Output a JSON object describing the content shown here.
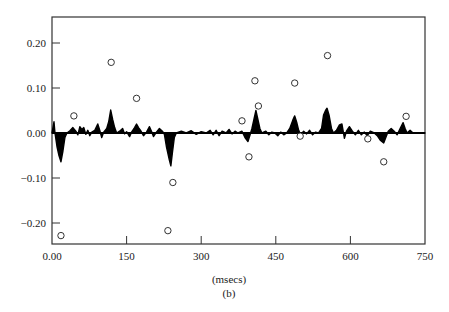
{
  "chart_data": {
    "type": "line",
    "title": "",
    "subtitle": "(b)",
    "xlabel": "(msecs)",
    "ylabel": "",
    "xlim": [
      0,
      750
    ],
    "ylim": [
      -0.25,
      0.26
    ],
    "grid": false,
    "legend": null,
    "x_ticks": [
      0,
      150,
      300,
      450,
      600,
      750
    ],
    "x_tick_labels": [
      "0.00",
      "150",
      "300",
      "450",
      "600",
      "750"
    ],
    "y_ticks": [
      0.2,
      0.1,
      0.0,
      -0.1,
      -0.2
    ],
    "y_tick_labels": [
      "0.20",
      "0.10",
      "0.00",
      "−0.10",
      "−0.20"
    ],
    "series": [
      {
        "name": "waveform",
        "style": "filled-area",
        "color": "#000000",
        "points": [
          [
            0,
            0
          ],
          [
            4,
            0.025
          ],
          [
            6,
            0.0
          ],
          [
            10,
            -0.03
          ],
          [
            14,
            -0.05
          ],
          [
            18,
            -0.064
          ],
          [
            22,
            -0.04
          ],
          [
            26,
            -0.01
          ],
          [
            30,
            0
          ],
          [
            36,
            0.005
          ],
          [
            42,
            0.012
          ],
          [
            48,
            0.004
          ],
          [
            52,
            -0.004
          ],
          [
            56,
            0.014
          ],
          [
            60,
            0.008
          ],
          [
            64,
            0.012
          ],
          [
            68,
            -0.003
          ],
          [
            72,
            0.006
          ],
          [
            76,
            -0.006
          ],
          [
            80,
            0.002
          ],
          [
            86,
            0.006
          ],
          [
            92,
            0.02
          ],
          [
            96,
            0.006
          ],
          [
            100,
            -0.01
          ],
          [
            104,
            0.002
          ],
          [
            110,
            0.01
          ],
          [
            114,
            0.025
          ],
          [
            118,
            0.051
          ],
          [
            122,
            0.03
          ],
          [
            126,
            0.012
          ],
          [
            130,
            0.0
          ],
          [
            136,
            0.004
          ],
          [
            142,
            0.01
          ],
          [
            146,
            -0.002
          ],
          [
            150,
            0.003
          ],
          [
            156,
            -0.008
          ],
          [
            160,
            0.002
          ],
          [
            166,
            0.012
          ],
          [
            170,
            0.02
          ],
          [
            174,
            0.012
          ],
          [
            178,
            0.006
          ],
          [
            184,
            -0.006
          ],
          [
            190,
            0.002
          ],
          [
            196,
            0.014
          ],
          [
            200,
            0.004
          ],
          [
            204,
            -0.008
          ],
          [
            210,
            0.002
          ],
          [
            216,
            0.01
          ],
          [
            222,
            0.004
          ],
          [
            226,
            -0.003
          ],
          [
            230,
            -0.03
          ],
          [
            236,
            -0.06
          ],
          [
            239,
            -0.073
          ],
          [
            242,
            -0.045
          ],
          [
            246,
            -0.01
          ],
          [
            250,
            0
          ],
          [
            260,
            0.004
          ],
          [
            270,
            0.0
          ],
          [
            280,
            0.005
          ],
          [
            290,
            -0.003
          ],
          [
            300,
            0.003
          ],
          [
            310,
            0.0
          ],
          [
            318,
            0.006
          ],
          [
            324,
            -0.004
          ],
          [
            330,
            0.006
          ],
          [
            336,
            -0.006
          ],
          [
            342,
            0.004
          ],
          [
            350,
            0.0
          ],
          [
            356,
            0.008
          ],
          [
            362,
            -0.002
          ],
          [
            368,
            0.004
          ],
          [
            374,
            0.0
          ],
          [
            382,
            0.004
          ],
          [
            388,
            -0.01
          ],
          [
            394,
            -0.019
          ],
          [
            398,
            -0.005
          ],
          [
            402,
            0.01
          ],
          [
            406,
            0.03
          ],
          [
            410,
            0.05
          ],
          [
            414,
            0.03
          ],
          [
            418,
            0.01
          ],
          [
            422,
            0.0
          ],
          [
            430,
            0.004
          ],
          [
            436,
            -0.004
          ],
          [
            442,
            0.002
          ],
          [
            448,
            0.0
          ],
          [
            454,
            -0.006
          ],
          [
            460,
            0.002
          ],
          [
            466,
            -0.004
          ],
          [
            472,
            0.0
          ],
          [
            478,
            0.01
          ],
          [
            484,
            0.028
          ],
          [
            488,
            0.038
          ],
          [
            492,
            0.024
          ],
          [
            496,
            0.006
          ],
          [
            500,
            -0.004
          ],
          [
            506,
            0.004
          ],
          [
            512,
            -0.002
          ],
          [
            518,
            0.006
          ],
          [
            524,
            -0.004
          ],
          [
            530,
            0.002
          ],
          [
            536,
            0.0
          ],
          [
            542,
            0.01
          ],
          [
            546,
            0.04
          ],
          [
            550,
            0.05
          ],
          [
            553,
            0.055
          ],
          [
            557,
            0.04
          ],
          [
            562,
            0.01
          ],
          [
            566,
            0.0
          ],
          [
            572,
            0.006
          ],
          [
            578,
            0.018
          ],
          [
            583,
            0.02
          ],
          [
            588,
            -0.012
          ],
          [
            592,
            0.004
          ],
          [
            598,
            0.014
          ],
          [
            604,
            0.004
          ],
          [
            610,
            -0.004
          ],
          [
            616,
            0.006
          ],
          [
            622,
            -0.004
          ],
          [
            628,
            0.002
          ],
          [
            634,
            -0.006
          ],
          [
            640,
            0.004
          ],
          [
            648,
            0.0
          ],
          [
            654,
            -0.006
          ],
          [
            660,
            -0.016
          ],
          [
            667,
            -0.022
          ],
          [
            672,
            -0.008
          ],
          [
            676,
            0.004
          ],
          [
            682,
            0.01
          ],
          [
            688,
            0.004
          ],
          [
            694,
            -0.004
          ],
          [
            700,
            0.01
          ],
          [
            706,
            0.023
          ],
          [
            710,
            0.01
          ],
          [
            714,
            0.0
          ],
          [
            720,
            0.006
          ],
          [
            726,
            0.0
          ],
          [
            750,
            0.0
          ]
        ]
      },
      {
        "name": "samples",
        "style": "open-circles",
        "color": "#333333",
        "points": [
          [
            18,
            -0.228
          ],
          [
            44,
            0.038
          ],
          [
            119,
            0.157
          ],
          [
            170,
            0.077
          ],
          [
            233,
            -0.217
          ],
          [
            243,
            -0.11
          ],
          [
            382,
            0.027
          ],
          [
            396,
            -0.053
          ],
          [
            408,
            0.116
          ],
          [
            415,
            0.06
          ],
          [
            488,
            0.111
          ],
          [
            499,
            -0.007
          ],
          [
            554,
            0.172
          ],
          [
            635,
            -0.013
          ],
          [
            667,
            -0.064
          ],
          [
            712,
            0.037
          ]
        ]
      }
    ]
  },
  "layout": {
    "plot_left": 52,
    "plot_right": 425,
    "plot_top": 17,
    "y_zero_px": 133,
    "px_per_unit_y": 450,
    "x_axis_px": 244
  }
}
